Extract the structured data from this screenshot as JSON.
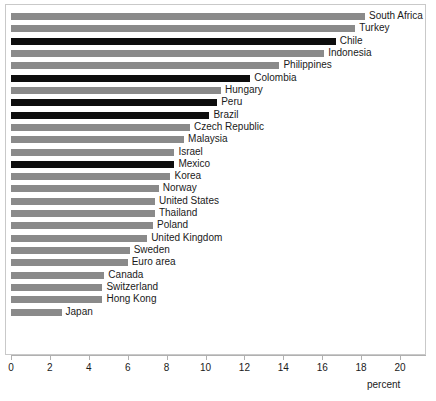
{
  "chart_data": {
    "type": "bar",
    "orientation": "horizontal",
    "title": "",
    "xlabel": "percent",
    "ylabel": "",
    "xlim": [
      0,
      20
    ],
    "xticks": [
      0,
      2,
      4,
      6,
      8,
      10,
      12,
      14,
      16,
      18,
      20
    ],
    "xtick_labels": [
      "0",
      "2",
      "4",
      "6",
      "8",
      "10",
      "12",
      "14",
      "16",
      "18",
      "20"
    ],
    "grid": false,
    "legend": "none",
    "colors": {
      "default_bar": "#8a8a8a",
      "highlight_bar": "#0d0d0d",
      "frame": "#c9c9c9",
      "axis": "#b0b0b0",
      "text": "#1a1a1a"
    },
    "categories": [
      "South Africa",
      "Turkey",
      "Chile",
      "Indonesia",
      "Philippines",
      "Colombia",
      "Hungary",
      "Peru",
      "Brazil",
      "Czech Republic",
      "Malaysia",
      "Israel",
      "Mexico",
      "Korea",
      "Norway",
      "United States",
      "Thailand",
      "Poland",
      "United Kingdom",
      "Sweden",
      "Euro area",
      "Canada",
      "Switzerland",
      "Hong Kong",
      "Japan"
    ],
    "values": [
      18.2,
      17.7,
      16.7,
      16.1,
      13.8,
      12.3,
      10.8,
      10.6,
      10.2,
      9.2,
      8.9,
      8.4,
      8.4,
      8.2,
      7.6,
      7.4,
      7.4,
      7.3,
      7.0,
      6.1,
      6.0,
      4.8,
      4.7,
      4.7,
      2.6
    ],
    "highlighted": [
      false,
      false,
      true,
      false,
      false,
      true,
      false,
      true,
      true,
      false,
      false,
      false,
      true,
      false,
      false,
      false,
      false,
      false,
      false,
      false,
      false,
      false,
      false,
      false,
      false
    ]
  }
}
